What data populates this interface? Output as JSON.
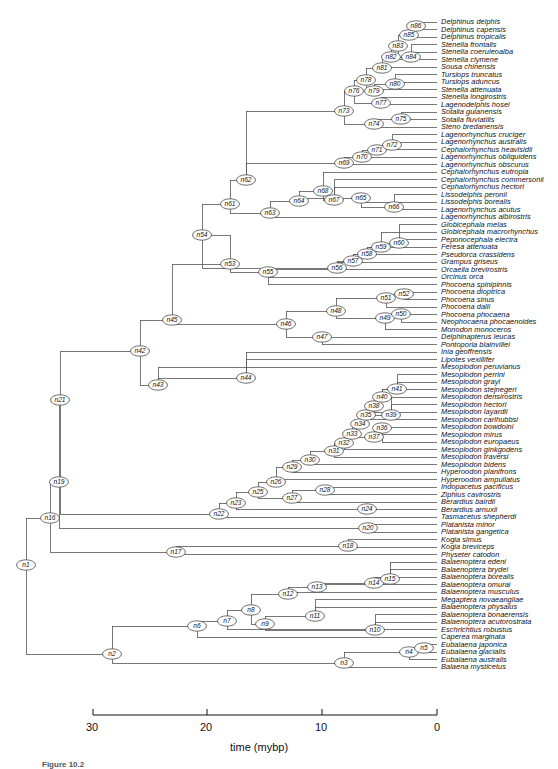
{
  "figure": {
    "caption": "Figure 10.2",
    "axis": {
      "title": "time (mybp)",
      "ticks": [
        "30",
        "20",
        "10",
        "0"
      ],
      "tick_values": [
        30,
        20,
        10,
        0
      ],
      "range": [
        30,
        0
      ]
    },
    "line_color": "#555555",
    "node_fill": "#ffffff",
    "node_stroke": "#333333",
    "text_color": "#111111"
  },
  "chart_data": {
    "type": "tree",
    "xlabel": "time (mybp)",
    "ylabel": "",
    "xlim": [
      30,
      0
    ],
    "grid": false,
    "legend": "none",
    "n_tips": 87,
    "n_nodes": 86,
    "tips": [
      {
        "name": "Delphinus delphis",
        "y": 22
      },
      {
        "name": "Delphinus capensis",
        "y": 29.5
      },
      {
        "name": "Delphinus tropicalis",
        "y": 37
      },
      {
        "name": "Stenella frontalis",
        "y": 44.5
      },
      {
        "name": "Stenella coeruleoalba",
        "y": 52
      },
      {
        "name": "Stenella clymene",
        "y": 59.5
      },
      {
        "name": "Sousa chinensis",
        "y": 67
      },
      {
        "name": "Tursiops truncatus",
        "y": 74.5
      },
      {
        "name": "Tursiops aduncus",
        "y": 82
      },
      {
        "name": "Stenella attenuata",
        "y": 89.5
      },
      {
        "name": "Stenella longirostris",
        "y": 97
      },
      {
        "name": "Lagenodelphis hosei",
        "y": 104.5
      },
      {
        "name": "Sotalia guianensis",
        "y": 112
      },
      {
        "name": "Sotalia fluviatilis",
        "y": 119.5
      },
      {
        "name": "Steno bredanensis",
        "y": 127
      },
      {
        "name": "Lagenorhynchus cruciger",
        "y": 134.5
      },
      {
        "name": "Lagenorhynchus australis",
        "y": 142
      },
      {
        "name": "Cephalorhynchus heavisidii",
        "y": 149.5
      },
      {
        "name": "Lagenorhynchus obliquidens",
        "y": 157
      },
      {
        "name": "Lagenorhynchus obscurus",
        "y": 164.5
      },
      {
        "name": "Cephalorhynchus eutropia",
        "y": 172
      },
      {
        "name": "Cephalorhynchus commersonii",
        "y": 179.5
      },
      {
        "name": "Cephalorhynchus hectori",
        "y": 187
      },
      {
        "name": "Lissodelphis peronii",
        "y": 194.5
      },
      {
        "name": "Lissodelphis borealis",
        "y": 202
      },
      {
        "name": "Lagenorhynchus acutus",
        "y": 209.5
      },
      {
        "name": "Lagenorhynchus albirostris",
        "y": 217
      },
      {
        "name": "Globicephala melas",
        "y": 224.5
      },
      {
        "name": "Globicephala macrorhynchus",
        "y": 232
      },
      {
        "name": "Peponocephala electra",
        "y": 239.5
      },
      {
        "name": "Feresa attenuata",
        "y": 247
      },
      {
        "name": "Pseudorca crassidens",
        "y": 254.5
      },
      {
        "name": "Grampus griseus",
        "y": 262
      },
      {
        "name": "Orcaella brevirostris",
        "y": 269.5
      },
      {
        "name": "Orcinus orca",
        "y": 277
      },
      {
        "name": "Phocoena spinipinnis",
        "y": 284.5
      },
      {
        "name": "Phocoena dioptrica",
        "y": 292
      },
      {
        "name": "Phocoena sinus",
        "y": 299.5
      },
      {
        "name": "Phocoena dalli",
        "y": 307
      },
      {
        "name": "Phocoena phocaena",
        "y": 314.5
      },
      {
        "name": "Neophocaena phocaenoides",
        "y": 322
      },
      {
        "name": "Monodon monoceros",
        "y": 329.5
      },
      {
        "name": "Delphinapterus leucas",
        "y": 337
      },
      {
        "name": "Pontoporia blainvillei",
        "y": 344.5
      },
      {
        "name": "Inia geoffrensis",
        "y": 352
      },
      {
        "name": "Lipotes vexillifer",
        "y": 359.5
      },
      {
        "name": "Mesoplodon peruvianus",
        "y": 367
      },
      {
        "name": "Mesoplodon perrini",
        "y": 374.5
      },
      {
        "name": "Mesoplodon grayi",
        "y": 382
      },
      {
        "name": "Mesoplodon stejnegeri",
        "y": 389.5
      },
      {
        "name": "Mesoplodon densirostris",
        "y": 397
      },
      {
        "name": "Mesoplodon hectori",
        "y": 404.5
      },
      {
        "name": "Mesoplodon layardii",
        "y": 412
      },
      {
        "name": "Mesoplodon carlhubbsi",
        "y": 419.5
      },
      {
        "name": "Mesoplodon bowdoini",
        "y": 427
      },
      {
        "name": "Mesoplodon mirus",
        "y": 434.5
      },
      {
        "name": "Mesoplodon europaeus",
        "y": 442
      },
      {
        "name": "Mesoplodon ginkgodens",
        "y": 449.5
      },
      {
        "name": "Mesoplodon traversi",
        "y": 457
      },
      {
        "name": "Mesoplodon bidens",
        "y": 464.5
      },
      {
        "name": "Hyperoodon planifrons",
        "y": 472
      },
      {
        "name": "Hyperoodon ampullatus",
        "y": 479.5
      },
      {
        "name": "Indopacetus pacificus",
        "y": 487
      },
      {
        "name": "Ziphius cavirostris",
        "y": 494.5
      },
      {
        "name": "Berardius bairdii",
        "y": 502
      },
      {
        "name": "Berardius arnuxii",
        "y": 509.5
      },
      {
        "name": "Tasmacetus shepherdi",
        "y": 517
      },
      {
        "name": "Platanista minor",
        "y": 524.5
      },
      {
        "name": "Platanista gangetica",
        "y": 532
      },
      {
        "name": "Kogia simus",
        "y": 539.5
      },
      {
        "name": "Kogia breviceps",
        "y": 547
      },
      {
        "name": "Physeter catodon",
        "y": 554.5
      },
      {
        "name": "Balaenoptera edeni",
        "y": 562
      },
      {
        "name": "Balaenoptera brydei",
        "y": 569.5
      },
      {
        "name": "Balaenoptera borealis",
        "y": 577
      },
      {
        "name": "Balaenoptera omurai",
        "y": 584.5
      },
      {
        "name": "Balaenoptera musculus",
        "y": 592
      },
      {
        "name": "Megaptera novaeangliae",
        "y": 599.5
      },
      {
        "name": "Balaenoptera physalus",
        "y": 607
      },
      {
        "name": "Balaenoptera bonaerensis",
        "y": 614.5
      },
      {
        "name": "Balaenoptera acutorostrata",
        "y": 622
      },
      {
        "name": "Eschrichtius robustus",
        "y": 629.5
      },
      {
        "name": "Caperea marginata",
        "y": 637
      },
      {
        "name": "Eubalaena japonica",
        "y": 644.5
      },
      {
        "name": "Eubalaena glacialis",
        "y": 652
      },
      {
        "name": "Eubalaena australis",
        "y": 659.5
      },
      {
        "name": "Balaena mysticetus",
        "y": 667
      }
    ],
    "internal_nodes": [
      {
        "id": "n1",
        "x": 26,
        "y": 565
      },
      {
        "id": "n2",
        "x": 112,
        "y": 654
      },
      {
        "id": "n3",
        "x": 344,
        "y": 663
      },
      {
        "id": "n4",
        "x": 409,
        "y": 652
      },
      {
        "id": "n5",
        "x": 424,
        "y": 648
      },
      {
        "id": "n6",
        "x": 197,
        "y": 626
      },
      {
        "id": "n7",
        "x": 227,
        "y": 621
      },
      {
        "id": "n8",
        "x": 251,
        "y": 610
      },
      {
        "id": "n9",
        "x": 265,
        "y": 624
      },
      {
        "id": "n10",
        "x": 375,
        "y": 630
      },
      {
        "id": "n11",
        "x": 315,
        "y": 616
      },
      {
        "id": "n12",
        "x": 288,
        "y": 594
      },
      {
        "id": "n13",
        "x": 317,
        "y": 587
      },
      {
        "id": "n14",
        "x": 374,
        "y": 583
      },
      {
        "id": "n15",
        "x": 390,
        "y": 579
      },
      {
        "id": "n16",
        "x": 50,
        "y": 518
      },
      {
        "id": "n17",
        "x": 176,
        "y": 552
      },
      {
        "id": "n18",
        "x": 348,
        "y": 546
      },
      {
        "id": "n19",
        "x": 59,
        "y": 482
      },
      {
        "id": "n20",
        "x": 368,
        "y": 528
      },
      {
        "id": "n21",
        "x": 60,
        "y": 400
      },
      {
        "id": "n22",
        "x": 219,
        "y": 514
      },
      {
        "id": "n23",
        "x": 236,
        "y": 503
      },
      {
        "id": "n24",
        "x": 367,
        "y": 509
      },
      {
        "id": "n25",
        "x": 258,
        "y": 492
      },
      {
        "id": "n26",
        "x": 276,
        "y": 482
      },
      {
        "id": "n27",
        "x": 292,
        "y": 498
      },
      {
        "id": "n28",
        "x": 325,
        "y": 490
      },
      {
        "id": "n29",
        "x": 292,
        "y": 467
      },
      {
        "id": "n30",
        "x": 310,
        "y": 460
      },
      {
        "id": "n31",
        "x": 334,
        "y": 451
      },
      {
        "id": "n32",
        "x": 344,
        "y": 443
      },
      {
        "id": "n33",
        "x": 352,
        "y": 434
      },
      {
        "id": "n34",
        "x": 360,
        "y": 424
      },
      {
        "id": "n35",
        "x": 366,
        "y": 415
      },
      {
        "id": "n36",
        "x": 382,
        "y": 428
      },
      {
        "id": "n37",
        "x": 374,
        "y": 437
      },
      {
        "id": "n38",
        "x": 374,
        "y": 406
      },
      {
        "id": "n39",
        "x": 391,
        "y": 415
      },
      {
        "id": "n40",
        "x": 382,
        "y": 397
      },
      {
        "id": "n41",
        "x": 397,
        "y": 389
      },
      {
        "id": "n42",
        "x": 140,
        "y": 351
      },
      {
        "id": "n43",
        "x": 158,
        "y": 385
      },
      {
        "id": "n44",
        "x": 246,
        "y": 378
      },
      {
        "id": "n45",
        "x": 172,
        "y": 320
      },
      {
        "id": "n46",
        "x": 286,
        "y": 324
      },
      {
        "id": "n47",
        "x": 322,
        "y": 337
      },
      {
        "id": "n48",
        "x": 336,
        "y": 311
      },
      {
        "id": "n49",
        "x": 385,
        "y": 318
      },
      {
        "id": "n50",
        "x": 401,
        "y": 314
      },
      {
        "id": "n51",
        "x": 386,
        "y": 298
      },
      {
        "id": "n52",
        "x": 404,
        "y": 294
      },
      {
        "id": "n53",
        "x": 230,
        "y": 264
      },
      {
        "id": "n54",
        "x": 202,
        "y": 235
      },
      {
        "id": "n55",
        "x": 268,
        "y": 272
      },
      {
        "id": "n56",
        "x": 337,
        "y": 268
      },
      {
        "id": "n57",
        "x": 353,
        "y": 261
      },
      {
        "id": "n58",
        "x": 367,
        "y": 254
      },
      {
        "id": "n59",
        "x": 381,
        "y": 247
      },
      {
        "id": "n60",
        "x": 399,
        "y": 243
      },
      {
        "id": "n61",
        "x": 230,
        "y": 204
      },
      {
        "id": "n62",
        "x": 246,
        "y": 180
      },
      {
        "id": "n63",
        "x": 270,
        "y": 213
      },
      {
        "id": "n64",
        "x": 299,
        "y": 201
      },
      {
        "id": "n65",
        "x": 361,
        "y": 198
      },
      {
        "id": "n66",
        "x": 394,
        "y": 207
      },
      {
        "id": "n67",
        "x": 334,
        "y": 200
      },
      {
        "id": "n68",
        "x": 323,
        "y": 191
      },
      {
        "id": "n69",
        "x": 344,
        "y": 163
      },
      {
        "id": "n70",
        "x": 362,
        "y": 157
      },
      {
        "id": "n71",
        "x": 377,
        "y": 150
      },
      {
        "id": "n72",
        "x": 392,
        "y": 145
      },
      {
        "id": "n73",
        "x": 344,
        "y": 111
      },
      {
        "id": "n74",
        "x": 374,
        "y": 124
      },
      {
        "id": "n75",
        "x": 401,
        "y": 119
      },
      {
        "id": "n76",
        "x": 354,
        "y": 91
      },
      {
        "id": "n77",
        "x": 381,
        "y": 103
      },
      {
        "id": "n78",
        "x": 366,
        "y": 80
      },
      {
        "id": "n79",
        "x": 374,
        "y": 91
      },
      {
        "id": "n80",
        "x": 395,
        "y": 84
      },
      {
        "id": "n81",
        "x": 382,
        "y": 68
      },
      {
        "id": "n82",
        "x": 391,
        "y": 57
      },
      {
        "id": "n83",
        "x": 398,
        "y": 46
      },
      {
        "id": "n84",
        "x": 411,
        "y": 57
      },
      {
        "id": "n85",
        "x": 409,
        "y": 35
      },
      {
        "id": "n86",
        "x": 416,
        "y": 26
      }
    ]
  }
}
